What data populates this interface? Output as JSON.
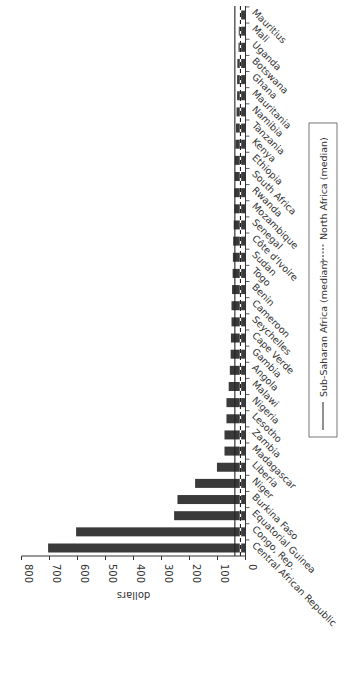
{
  "chart_data": {
    "type": "bar",
    "orientation": "rotated-90-clockwise",
    "title": "",
    "xlabel": "",
    "ylabel": "dollars",
    "ylim": [
      0,
      800
    ],
    "yticks": [
      0,
      100,
      200,
      300,
      400,
      500,
      600,
      700,
      800
    ],
    "grid": false,
    "categories": [
      "Central African Republic",
      "Congo, Rep.",
      "Equatorial Guinea",
      "Burkina Faso",
      "Niger",
      "Liberia",
      "Madagascar",
      "Zambia",
      "Lesotho",
      "Nigeria",
      "Malawi",
      "Angola",
      "Gambia",
      "Cape Verde",
      "Seychelles",
      "Cameroon",
      "Benin",
      "Togo",
      "Sudan",
      "Côte d'Ivoire",
      "Senegal",
      "Mozambique",
      "Rwanda",
      "South Africa",
      "Ethiopia",
      "Kenya",
      "Tanzania",
      "Namibia",
      "Mauritania",
      "Ghana",
      "Botswana",
      "Uganda",
      "Mali",
      "Mauritius"
    ],
    "series": [
      {
        "name": "Country value",
        "color": "#3a3a3a",
        "values": [
          705,
          605,
          255,
          243,
          180,
          102,
          75,
          75,
          68,
          68,
          60,
          56,
          53,
          52,
          50,
          50,
          48,
          46,
          45,
          44,
          42,
          40,
          40,
          38,
          38,
          36,
          34,
          32,
          30,
          30,
          29,
          25,
          24,
          18
        ]
      }
    ],
    "reference_lines": [
      {
        "name": "Sub-Saharan Africa (median)",
        "value": 38,
        "style": "solid",
        "color": "#222222"
      },
      {
        "name": "North Africa (median)",
        "value": 18,
        "style": "dashed",
        "color": "#222222"
      }
    ],
    "legend": {
      "placement": "right",
      "entries": [
        {
          "label": "Sub-Saharan Africa (median)",
          "style": "solid"
        },
        {
          "label": "North Africa (median)",
          "style": "dashed"
        }
      ]
    }
  }
}
